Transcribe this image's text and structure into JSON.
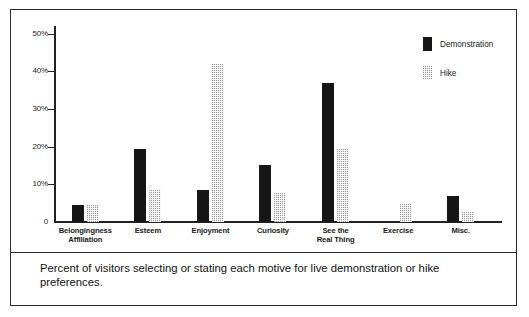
{
  "chart_data": {
    "type": "bar",
    "title": "",
    "subtitle": "",
    "xlabel": "",
    "ylabel": "",
    "ylim": [
      0,
      52
    ],
    "grid": false,
    "legend_position": "top-right",
    "categories": [
      "Belongingness\nAffiliation",
      "Esteem",
      "Enjoyment",
      "Curiosity",
      "See the\nReal Thing",
      "Exercise",
      "Misc."
    ],
    "category_lines": [
      [
        "Belongingness",
        "Affiliation"
      ],
      [
        "Esteem"
      ],
      [
        "Enjoyment"
      ],
      [
        "Curiosity"
      ],
      [
        "See the",
        "Real Thing"
      ],
      [
        "Exercise"
      ],
      [
        "Misc."
      ]
    ],
    "series": [
      {
        "name": "Demonstration",
        "color": "#161616",
        "values": [
          4.5,
          19.5,
          8.5,
          15.0,
          37.0,
          0,
          7.0
        ]
      },
      {
        "name": "Hike",
        "color": "#9a9a9a",
        "values": [
          4.5,
          8.5,
          42.0,
          7.8,
          19.3,
          4.7,
          2.6
        ]
      }
    ],
    "yticks": [
      0,
      10,
      20,
      30,
      40,
      50
    ],
    "ytick_labels": [
      "0",
      "10%",
      "20%",
      "30%",
      "40%",
      "50%"
    ]
  },
  "legend": {
    "items": [
      {
        "label": "Demonstration",
        "swatch": "solid-black"
      },
      {
        "label": "Hike",
        "swatch": "checkered-gray"
      }
    ]
  },
  "caption": {
    "text": "Percent of visitors selecting or stating each motive for live demonstration or hike preferences."
  }
}
